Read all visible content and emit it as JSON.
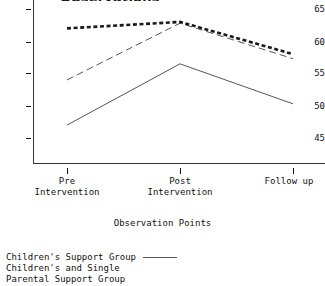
{
  "chart_data": {
    "type": "line",
    "title": "Observations",
    "title_truncated": true,
    "xlabel": "Observation Points",
    "ylabel": "",
    "categories": [
      "Pre Intervention",
      "Post Intervention",
      "Follow up"
    ],
    "x_tick_labels": [
      {
        "line1": "Pre",
        "line2": "Intervention"
      },
      {
        "line1": "Post",
        "line2": "Intervention"
      },
      {
        "line1": "Follow up",
        "line2": ""
      }
    ],
    "y_tick_labels": [
      "65",
      "60",
      "55",
      "50",
      "45"
    ],
    "y_tick_values": [
      65,
      60,
      55,
      50,
      45
    ],
    "ylim": [
      42.5,
      66.5
    ],
    "grid": false,
    "legend_position": "below-plot-left",
    "series": [
      {
        "name": "Children's Support Group",
        "style": "solid",
        "color": "#555555",
        "width": 1,
        "values": [
          47.0,
          56.5,
          50.3
        ]
      },
      {
        "name": "Children's and Single Parental Support Group",
        "style": "dashed",
        "color": "#555555",
        "width": 1,
        "values": [
          54.0,
          62.8,
          57.3
        ]
      },
      {
        "name": "Control Group",
        "style": "thick-dashed",
        "color": "#1a1a1a",
        "width": 2.6,
        "values": [
          62.0,
          63.0,
          58.0
        ]
      }
    ]
  },
  "legend": {
    "rows": [
      {
        "label": "Children's Support Group",
        "sample": "solid-line"
      },
      {
        "label": "Children's and Single",
        "sample": "none"
      },
      {
        "label": "Parental Support Group",
        "sample": "none"
      }
    ]
  },
  "axis": {
    "x_title": "Observation Points"
  },
  "colors": {
    "ink": "#111111",
    "line_gray": "#555555",
    "line_dark": "#1a1a1a",
    "background": "#ffffff"
  }
}
